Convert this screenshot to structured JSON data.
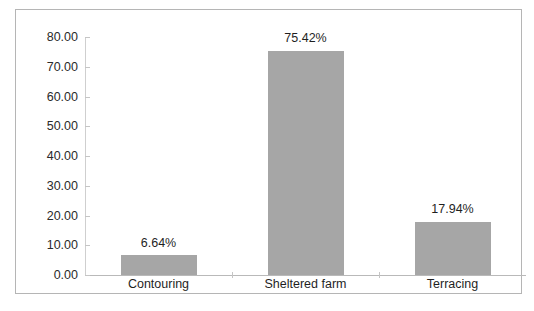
{
  "chart_data": {
    "type": "bar",
    "title": "",
    "subtitle": "",
    "xlabel": "",
    "ylabel": "",
    "categories": [
      "Contouring",
      "Sheltered farm",
      "Terracing"
    ],
    "values": [
      6.64,
      75.42,
      17.94
    ],
    "data_labels": [
      "6.64%",
      "75.42%",
      "17.94%"
    ],
    "ylim": [
      0,
      80
    ],
    "ytick_labels": [
      "0.00",
      "10.00",
      "20.00",
      "30.00",
      "40.00",
      "50.00",
      "60.00",
      "70.00",
      "80.00"
    ],
    "ytick_values": [
      0,
      10,
      20,
      30,
      40,
      50,
      60,
      70,
      80
    ],
    "grid": false,
    "legend": false,
    "legend_position": "none",
    "bar_color": "#a6a6a6",
    "axis_color": "#c5c5c5",
    "frame_color": "#b5b5b5",
    "background_color": "#ffffff",
    "text_color": "#1f1f1f"
  },
  "caption": {
    "text": ""
  }
}
